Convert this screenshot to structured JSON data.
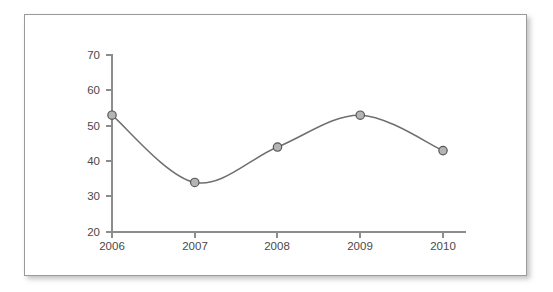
{
  "card": {
    "border_color": "#9a9a9a",
    "background": "#ffffff"
  },
  "chart_data": {
    "type": "line",
    "title": "",
    "subtitle": "",
    "xlabel": "",
    "ylabel": "",
    "categories": [
      "2006",
      "2007",
      "2008",
      "2009",
      "2010"
    ],
    "values": [
      53,
      34,
      44,
      53,
      43
    ],
    "series": [
      {
        "name": "",
        "values": [
          53,
          34,
          44,
          53,
          43
        ]
      }
    ],
    "x_tick_labels": [
      "2006",
      "2007",
      "2008",
      "2009",
      "2010"
    ],
    "y_tick_labels": [
      "20",
      "30",
      "40",
      "50",
      "60",
      "70"
    ],
    "y_ticks": [
      20,
      30,
      40,
      50,
      60,
      70
    ],
    "ylim": [
      20,
      70
    ],
    "grid": false,
    "legend": false,
    "legend_position": "none",
    "smoothing": "spline",
    "line_color": "#6f6f6f",
    "marker_fill": "#b4b4b4",
    "marker_edge": "#575757",
    "axis_color": "#8c8c8c",
    "label_color": "#4a4a4a",
    "plot_background": "#ffffff"
  }
}
